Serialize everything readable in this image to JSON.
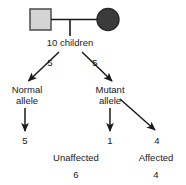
{
  "diagram": {
    "type": "pedigree-inheritance-flow",
    "parents": [
      {
        "symbol": "square",
        "meaning": "male-unaffected",
        "fill": "#d4d4d4",
        "stroke": "#555555"
      },
      {
        "symbol": "circle",
        "meaning": "female-affected",
        "fill": "#3b3b3b",
        "stroke": "#2a2a2a"
      }
    ],
    "offspring_label": "10 children",
    "branch_counts": {
      "left": "5",
      "right": "5"
    },
    "alleles": {
      "left": {
        "line1": "Normal",
        "line2": "allele"
      },
      "right": {
        "line1": "Mutant",
        "line2": "allele"
      }
    },
    "outcome_counts": {
      "normal": "5",
      "mutant_unaffected": "1",
      "mutant_affected": "4"
    },
    "status_labels": {
      "unaffected": "Unaffected",
      "affected": "Affected"
    },
    "totals": {
      "unaffected": "6",
      "affected": "4"
    },
    "colors": {
      "line": "#1a1a1a",
      "text": "#1a1a1a",
      "background": "#ffffff"
    }
  }
}
